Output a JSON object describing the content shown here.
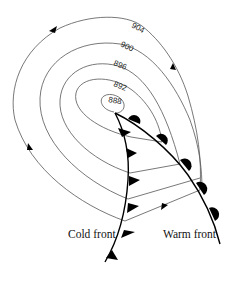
{
  "diagram": {
    "type": "weather-map-low-pressure-system",
    "isobars": [
      {
        "label": "888"
      },
      {
        "label": "892"
      },
      {
        "label": "896"
      },
      {
        "label": "900"
      },
      {
        "label": "904"
      }
    ],
    "fronts": {
      "cold": {
        "label": "Cold front"
      },
      "warm": {
        "label": "Warm front"
      }
    }
  }
}
